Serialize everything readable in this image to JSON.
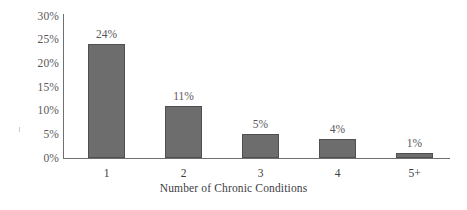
{
  "chart_data": {
    "type": "bar",
    "title": "",
    "xlabel": "Number of Chronic Conditions",
    "ylabel": "",
    "categories": [
      "1",
      "2",
      "3",
      "4",
      "5+"
    ],
    "values": [
      24,
      11,
      5,
      4,
      1
    ],
    "data_labels": [
      "24%",
      "11%",
      "5%",
      "4%",
      "1%"
    ],
    "ylim": [
      0,
      30
    ],
    "ytick_values": [
      30,
      25,
      20,
      15,
      10,
      5,
      0
    ],
    "ytick_labels": [
      "30%",
      "25%",
      "20%",
      "15%",
      "10%",
      "5%",
      "0%"
    ],
    "grid": false,
    "legend": null,
    "series": [
      {
        "name": "Share of population",
        "values": [
          24,
          11,
          5,
          4,
          1
        ]
      }
    ],
    "colors": {
      "bar_fill": "#6d6d6d",
      "bar_stroke": "#505050",
      "axis": "#6f6f6f",
      "text": "#3d3d3f",
      "background": "#ffffff"
    }
  }
}
